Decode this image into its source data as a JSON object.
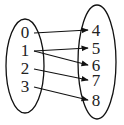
{
  "diagram": {
    "type": "mapping",
    "domain": {
      "elements": [
        {
          "label": "0",
          "x": 25,
          "y": 38
        },
        {
          "label": "1",
          "x": 25,
          "y": 56
        },
        {
          "label": "2",
          "x": 25,
          "y": 74
        },
        {
          "label": "3",
          "x": 25,
          "y": 92
        }
      ]
    },
    "codomain": {
      "elements": [
        {
          "label": "4",
          "x": 96,
          "y": 36
        },
        {
          "label": "5",
          "x": 96,
          "y": 54
        },
        {
          "label": "6",
          "x": 96,
          "y": 71
        },
        {
          "label": "7",
          "x": 96,
          "y": 86
        },
        {
          "label": "8",
          "x": 96,
          "y": 106
        }
      ]
    },
    "arrows": [
      {
        "from": "0",
        "to": "4"
      },
      {
        "from": "1",
        "to": "5"
      },
      {
        "from": "1",
        "to": "6"
      },
      {
        "from": "2",
        "to": "7"
      },
      {
        "from": "3",
        "to": "8"
      }
    ]
  }
}
